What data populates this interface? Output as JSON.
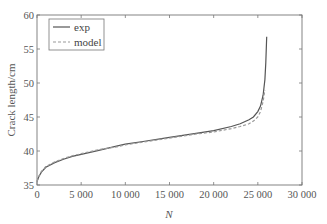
{
  "chart_data": {
    "type": "line",
    "title": "",
    "xlabel": "N",
    "ylabel": "Crack length/cm",
    "xlim": [
      0,
      30000
    ],
    "ylim": [
      35,
      60
    ],
    "x_ticks": [
      0,
      5000,
      10000,
      15000,
      20000,
      25000,
      30000
    ],
    "x_tick_labels": [
      "0",
      "5 000",
      "10 000",
      "15 000",
      "20 000",
      "25 000",
      "30 000"
    ],
    "y_ticks": [
      35,
      40,
      45,
      50,
      55,
      60
    ],
    "y_tick_labels": [
      "35",
      "40",
      "45",
      "50",
      "55",
      "60"
    ],
    "grid": false,
    "legend_position": "upper left",
    "series": [
      {
        "name": "exp",
        "style": "solid",
        "color": "#555555",
        "x": [
          0,
          200,
          500,
          1000,
          2000,
          3000,
          4000,
          5000,
          7000,
          9000,
          10000,
          12000,
          15000,
          18000,
          20000,
          22000,
          23000,
          24000,
          24500,
          25000,
          25300,
          25600,
          25800,
          25900,
          26000
        ],
        "y": [
          35.5,
          36.2,
          36.9,
          37.6,
          38.3,
          38.8,
          39.2,
          39.5,
          40.1,
          40.7,
          41.0,
          41.4,
          42.0,
          42.6,
          43.0,
          43.6,
          44.0,
          44.6,
          45.0,
          45.8,
          46.6,
          48.2,
          50.5,
          53.0,
          56.8
        ]
      },
      {
        "name": "model",
        "style": "dashed",
        "color": "#999999",
        "x": [
          0,
          200,
          500,
          1000,
          2000,
          3000,
          4000,
          5000,
          7000,
          9000,
          10000,
          12000,
          15000,
          18000,
          20000,
          22000,
          23000,
          24000,
          24500,
          25000,
          25300,
          25600,
          25800
        ],
        "y": [
          35.5,
          36.3,
          37.0,
          37.7,
          38.4,
          38.9,
          39.3,
          39.6,
          40.2,
          40.6,
          40.9,
          41.3,
          41.9,
          42.5,
          42.8,
          43.3,
          43.6,
          44.0,
          44.4,
          45.0,
          45.8,
          47.3,
          49.0
        ]
      }
    ]
  },
  "legend": {
    "items": [
      {
        "label": "exp"
      },
      {
        "label": "model"
      }
    ]
  }
}
